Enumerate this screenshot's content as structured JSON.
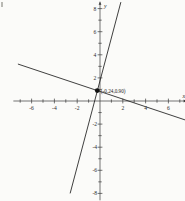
{
  "chart_data": {
    "type": "line",
    "title": "",
    "xlabel": "x",
    "ylabel": "y",
    "xlim": [
      -7.6,
      7.6
    ],
    "ylim": [
      -8.6,
      8.6
    ],
    "grid": false,
    "legend": null,
    "xticks": [
      -6,
      -4,
      -2,
      2,
      4,
      6
    ],
    "xtick_labels": [
      "-6",
      "-4",
      "-2",
      "2",
      "4",
      "6"
    ],
    "yticks": [
      -8,
      -6,
      -4,
      -2,
      2,
      4,
      6,
      8
    ],
    "ytick_labels": [
      "-8",
      "-6",
      "-4",
      "-2",
      "2",
      "4",
      "6",
      "8"
    ],
    "minor_tick_step": 1,
    "series": [
      {
        "name": "steep-line",
        "type": "line",
        "slope": 3.7,
        "intercept": 1.79,
        "x": [
          -2.62,
          1.83
        ],
        "y": [
          -8.0,
          8.56
        ]
      },
      {
        "name": "shallow-line",
        "type": "line",
        "slope": -0.33,
        "intercept": 0.82,
        "x": [
          -7.2,
          7.5
        ],
        "y": [
          3.2,
          -1.65
        ]
      }
    ],
    "annotations": [
      {
        "name": "intersection-point",
        "label": "(-0.24,0.90)",
        "x": -0.24,
        "y": 0.9,
        "marker": "dot"
      }
    ],
    "colors": {
      "background": "#fbfbf9",
      "axis": "#3a3a3a",
      "line": "#1d1d1d",
      "text": "#2b2b2b",
      "marker": "#111111"
    }
  }
}
